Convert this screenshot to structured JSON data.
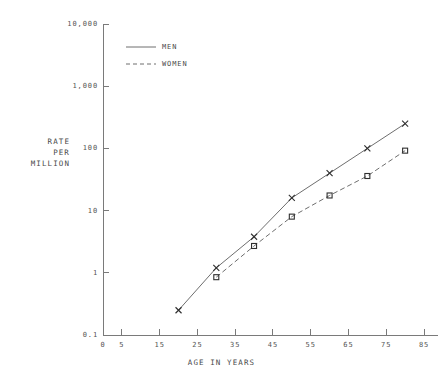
{
  "chart_data": {
    "type": "line",
    "title": "",
    "xlabel": "AGE IN YEARS",
    "ylabel_lines": [
      "RATE",
      "PER",
      "MILLION"
    ],
    "ylabel": "RATE PER MILLION",
    "yscale": "log",
    "xscale": "linear",
    "xlim": [
      0,
      85
    ],
    "ylim": [
      0.1,
      10000
    ],
    "grid": false,
    "legend_position": "upper-left-inside",
    "x_ticks": [
      {
        "value": 0,
        "label": "0"
      },
      {
        "value": 5,
        "label": "5"
      },
      {
        "value": 15,
        "label": "15"
      },
      {
        "value": 25,
        "label": "25"
      },
      {
        "value": 35,
        "label": "35"
      },
      {
        "value": 45,
        "label": "45"
      },
      {
        "value": 55,
        "label": "55"
      },
      {
        "value": 65,
        "label": "65"
      },
      {
        "value": 75,
        "label": "75"
      },
      {
        "value": 85,
        "label": "85"
      }
    ],
    "y_ticks": [
      {
        "value": 0.1,
        "label": "0.1"
      },
      {
        "value": 1,
        "label": "1"
      },
      {
        "value": 10,
        "label": "10"
      },
      {
        "value": 100,
        "label": "100"
      },
      {
        "value": 1000,
        "label": "1,000"
      },
      {
        "value": 10000,
        "label": "10,000"
      }
    ],
    "series": [
      {
        "name": "MEN",
        "marker": "x",
        "linestyle": "solid",
        "color": "#6e6e6e",
        "x": [
          20,
          30,
          40,
          50,
          60,
          70,
          80
        ],
        "values": [
          0.25,
          1.2,
          3.8,
          16,
          40,
          100,
          250
        ]
      },
      {
        "name": "WOMEN",
        "marker": "square",
        "linestyle": "dashed",
        "color": "#6e6e6e",
        "x": [
          30,
          40,
          50,
          60,
          70,
          80
        ],
        "values": [
          0.85,
          2.7,
          8,
          17.5,
          36,
          92
        ]
      }
    ],
    "legend": [
      {
        "label": "MEN",
        "linestyle": "solid"
      },
      {
        "label": "WOMEN",
        "linestyle": "dashed"
      }
    ]
  }
}
